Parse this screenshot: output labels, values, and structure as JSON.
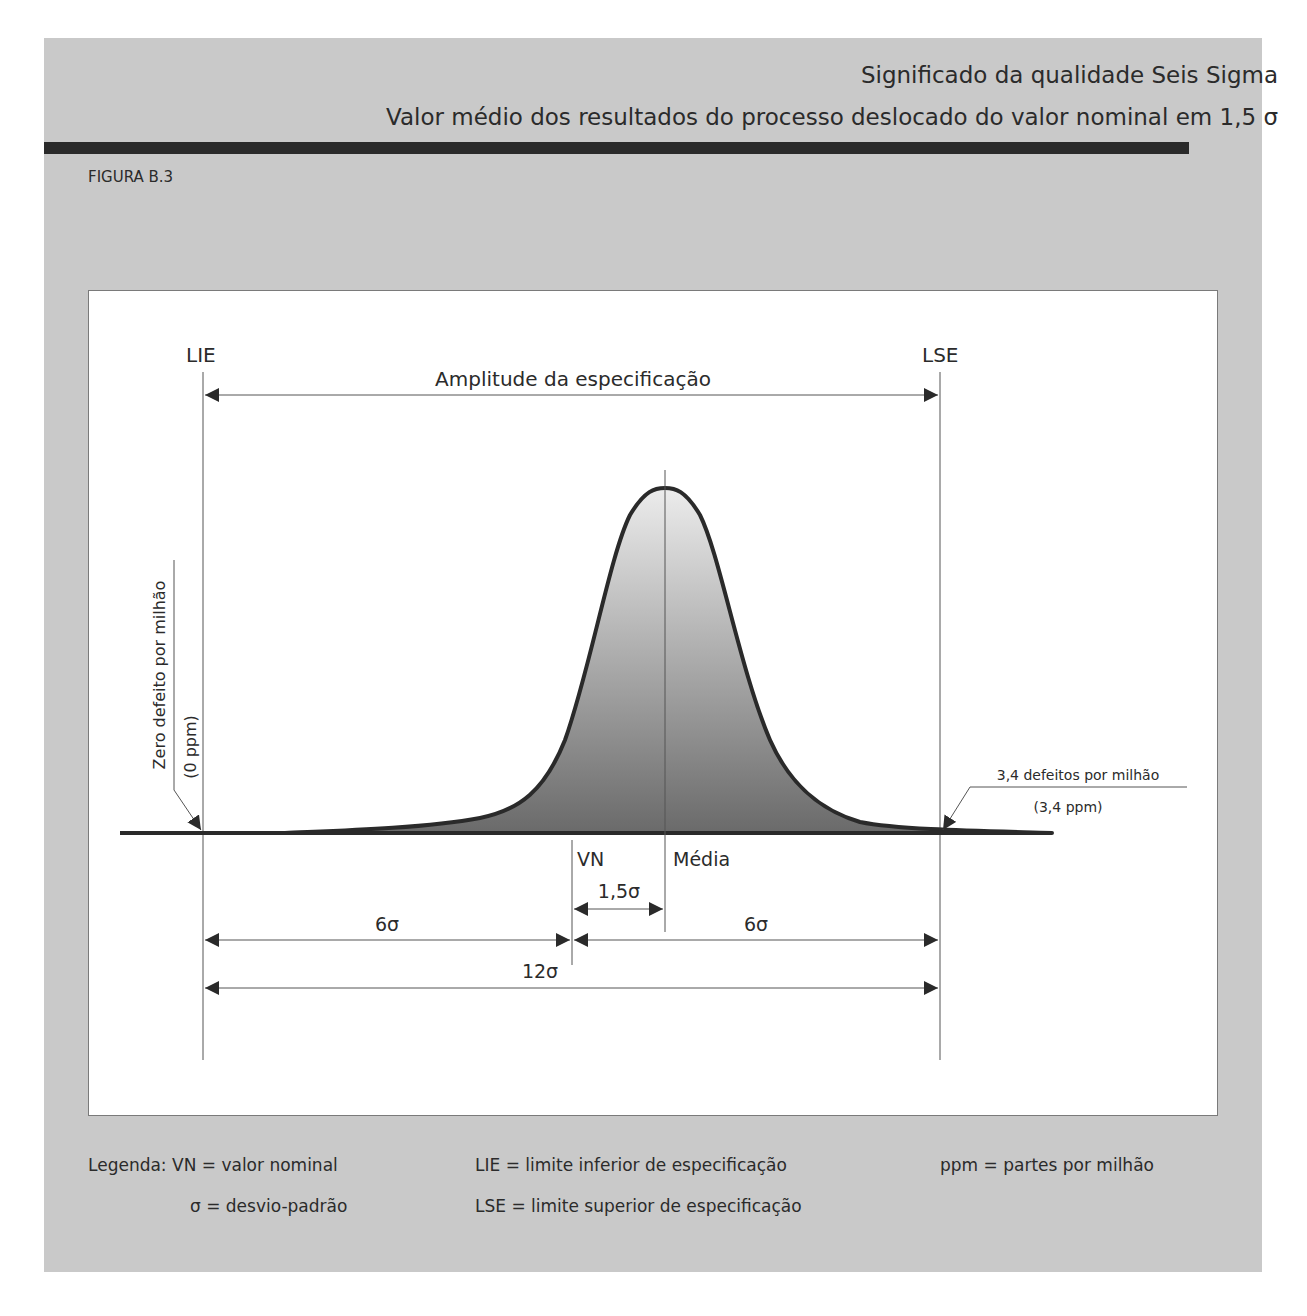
{
  "header": {
    "title": "Significado da qualidade Seis Sigma",
    "subtitle": "Valor médio dos resultados do processo deslocado do valor nominal em 1,5 σ",
    "figure_label": "FIGURA B.3"
  },
  "diagram": {
    "lie_label": "LIE",
    "lse_label": "LSE",
    "spec_range_label": "Amplitude da especificação",
    "zero_defect_label": "Zero defeito por milhão",
    "zero_defect_ppm": "(0 ppm)",
    "defects_label": "3,4 defeitos por milhão",
    "defects_ppm": "(3,4 ppm)",
    "vn_label": "VN",
    "mean_label": "Média",
    "shift_label": "1,5σ",
    "left_span_label": "6σ",
    "right_span_label": "6σ",
    "total_span_label": "12σ"
  },
  "legend": {
    "title": "Legenda:",
    "items": [
      "VN = valor nominal",
      "LIE = limite inferior de especificação",
      "ppm = partes por milhão",
      "σ = desvio-padrão",
      "LSE = limite superior de especificação"
    ]
  },
  "colors": {
    "panel": "#c9c9c9",
    "rule": "#2a2a2a",
    "curve_stroke": "#2a2a2a",
    "curve_fill_top": "#e8e8e8",
    "curve_fill_bottom": "#6e6e6e"
  }
}
